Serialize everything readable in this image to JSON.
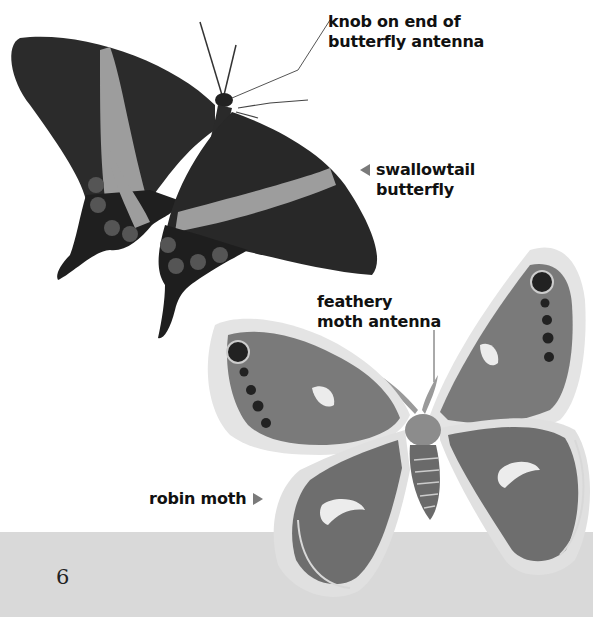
{
  "page": {
    "number": "6",
    "band_color": "#d9d9d9"
  },
  "labels": {
    "butterfly_antenna": {
      "line1": "knob on end of",
      "line2": "butterfly antenna"
    },
    "swallowtail": {
      "line1": "swallowtail",
      "line2": "butterfly",
      "arrow": "left-arrow"
    },
    "moth_antenna": {
      "line1": "feathery",
      "line2": "moth antenna"
    },
    "robin_moth": {
      "text": "robin moth",
      "arrow": "right-arrow"
    }
  },
  "images": {
    "butterfly": {
      "caption": "swallowtail butterfly",
      "wing_color": "#2a2a2a",
      "band_color": "#9a9a9a"
    },
    "moth": {
      "caption": "robin moth",
      "wing_color": "#7d7d7d",
      "edge_color": "#e2e2e2"
    }
  }
}
